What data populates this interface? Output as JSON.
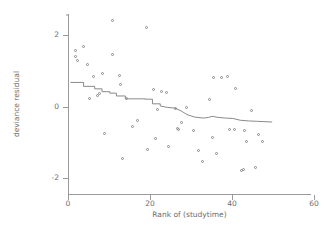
{
  "chart_data": {
    "type": "scatter",
    "title": "",
    "xlabel": "Rank of (studytime)",
    "ylabel": "deviance residual",
    "xlim": [
      0,
      60
    ],
    "ylim": [
      -2.45,
      2.6
    ],
    "xticks": [
      0,
      20,
      40,
      60
    ],
    "yticks": [
      2,
      0,
      -2
    ],
    "xticklabels": [
      "0",
      "20",
      "40",
      "60"
    ],
    "yticklabels": [
      "2",
      "0",
      "-2"
    ],
    "grid": false,
    "legend": null,
    "marker": "open-circle",
    "marker_color": "#8a8a8a",
    "line_color": "#7d7d7d",
    "axis_color": "#9a9a9a",
    "background": "#ffffff",
    "series": [
      {
        "name": "deviance residual",
        "type": "scatter",
        "points": [
          [
            1.8,
            1.58
          ],
          [
            1.8,
            1.4
          ],
          [
            2.2,
            1.3
          ],
          [
            3.9,
            1.7
          ],
          [
            4.8,
            1.18
          ],
          [
            5.3,
            0.24
          ],
          [
            6.3,
            0.84
          ],
          [
            7.2,
            0.3
          ],
          [
            7.7,
            0.36
          ],
          [
            8.4,
            0.92
          ],
          [
            9.0,
            -0.74
          ],
          [
            10.8,
            2.42
          ],
          [
            10.9,
            1.45
          ],
          [
            12.5,
            0.88
          ],
          [
            12.9,
            0.62
          ],
          [
            13.3,
            -1.45
          ],
          [
            14.3,
            0.22
          ],
          [
            15.8,
            -0.55
          ],
          [
            17.0,
            -0.4
          ],
          [
            19.2,
            2.21
          ],
          [
            19.4,
            -1.21
          ],
          [
            20.9,
            0.48
          ],
          [
            21.3,
            -0.88
          ],
          [
            21.8,
            -0.09
          ],
          [
            22.9,
            0.42
          ],
          [
            24.0,
            0.4
          ],
          [
            24.4,
            -1.13
          ],
          [
            26.2,
            -0.05
          ],
          [
            26.8,
            -0.62
          ],
          [
            27.0,
            -0.63
          ],
          [
            27.8,
            -0.43
          ],
          [
            29.0,
            -0.02
          ],
          [
            30.6,
            -0.66
          ],
          [
            31.9,
            -1.22
          ],
          [
            32.7,
            -1.55
          ],
          [
            34.6,
            0.2
          ],
          [
            35.2,
            -0.87
          ],
          [
            35.6,
            0.82
          ],
          [
            36.3,
            -1.3
          ],
          [
            37.4,
            0.83
          ],
          [
            38.9,
            0.86
          ],
          [
            39.5,
            -0.64
          ],
          [
            40.5,
            -0.65
          ],
          [
            40.8,
            0.52
          ],
          [
            42.3,
            -1.78
          ],
          [
            42.9,
            -1.76
          ],
          [
            43.1,
            -0.66
          ],
          [
            43.6,
            -0.98
          ],
          [
            44.8,
            -0.1
          ],
          [
            45.8,
            -1.72
          ],
          [
            46.4,
            -0.78
          ],
          [
            47.4,
            -0.97
          ]
        ]
      },
      {
        "name": "fitted step line",
        "type": "step-line",
        "points": [
          [
            0.6,
            0.68
          ],
          [
            3.8,
            0.68
          ],
          [
            3.8,
            0.57
          ],
          [
            6.5,
            0.57
          ],
          [
            6.5,
            0.5
          ],
          [
            8.3,
            0.5
          ],
          [
            8.3,
            0.42
          ],
          [
            10.2,
            0.42
          ],
          [
            10.2,
            0.38
          ],
          [
            11.8,
            0.38
          ],
          [
            11.8,
            0.3
          ],
          [
            14.0,
            0.3
          ],
          [
            14.0,
            0.22
          ],
          [
            18.8,
            0.22
          ],
          [
            18.8,
            0.21
          ],
          [
            20.6,
            0.21
          ],
          [
            20.6,
            0.08
          ],
          [
            22.5,
            0.08
          ],
          [
            22.5,
            0.02
          ],
          [
            24.2,
            -0.02
          ],
          [
            26.1,
            -0.04
          ],
          [
            27.6,
            -0.12
          ],
          [
            29.0,
            -0.22
          ],
          [
            30.8,
            -0.29
          ],
          [
            33.0,
            -0.32
          ],
          [
            34.3,
            -0.3
          ],
          [
            35.2,
            -0.27
          ],
          [
            36.6,
            -0.3
          ],
          [
            38.4,
            -0.32
          ],
          [
            40.2,
            -0.33
          ],
          [
            42.0,
            -0.38
          ],
          [
            44.0,
            -0.4
          ],
          [
            46.0,
            -0.41
          ],
          [
            49.8,
            -0.43
          ]
        ]
      }
    ]
  }
}
